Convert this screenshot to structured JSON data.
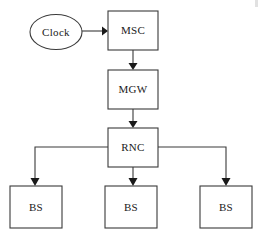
{
  "diagram": {
    "type": "block-diagram",
    "background_color": "#ffffff",
    "line_color": "#3a3a3a",
    "text_color": "#1a1a1a",
    "nodes": [
      {
        "id": "clock",
        "label": "Clock",
        "shape": "ellipse",
        "cx": 56,
        "cy": 32,
        "rx": 26,
        "ry": 17.5
      },
      {
        "id": "msc",
        "label": "MSC",
        "shape": "rect",
        "x": 108,
        "y": 11,
        "width": 50,
        "height": 39
      },
      {
        "id": "mgw",
        "label": "MGW",
        "shape": "rect",
        "x": 108,
        "y": 70,
        "width": 50,
        "height": 39
      },
      {
        "id": "rnc",
        "label": "RNC",
        "shape": "rect",
        "x": 108,
        "y": 128,
        "width": 50,
        "height": 39
      },
      {
        "id": "bs-left",
        "label": "BS",
        "shape": "rect",
        "x": 10,
        "y": 186,
        "width": 52,
        "height": 42
      },
      {
        "id": "bs-center",
        "label": "BS",
        "shape": "rect",
        "x": 105,
        "y": 186,
        "width": 52,
        "height": 42
      },
      {
        "id": "bs-right",
        "label": "BS",
        "shape": "rect",
        "x": 200,
        "y": 186,
        "width": 52,
        "height": 42
      }
    ],
    "edges": [
      {
        "id": "clock-to-msc",
        "from": "clock",
        "to": "msc",
        "arrow": true,
        "path": "M 82 31 L 103 31"
      },
      {
        "id": "msc-to-mgw",
        "from": "msc",
        "to": "mgw",
        "arrow": true,
        "path": "M 133 50 L 133 64"
      },
      {
        "id": "mgw-to-rnc",
        "from": "mgw",
        "to": "rnc",
        "arrow": true,
        "path": "M 133 109 L 133 122"
      },
      {
        "id": "rnc-to-bs-left",
        "from": "rnc",
        "to": "bs-left",
        "arrow": true,
        "path": "M 108 147 L 35 147 L 35 180"
      },
      {
        "id": "rnc-to-bs-center",
        "from": "rnc",
        "to": "bs-center",
        "arrow": true,
        "path": "M 133 167 L 133 180"
      },
      {
        "id": "rnc-to-bs-right",
        "from": "rnc",
        "to": "bs-right",
        "arrow": true,
        "path": "M 158 147 L 226 147 L 226 180"
      }
    ]
  }
}
